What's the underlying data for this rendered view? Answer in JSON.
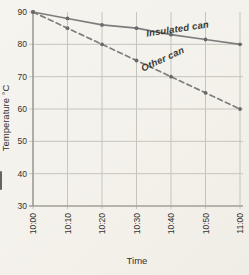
{
  "chart_data": {
    "type": "line",
    "title": "",
    "xlabel": "Time",
    "ylabel": "Temperature °C",
    "categories": [
      "10:00",
      "10:10",
      "10:20",
      "10:30",
      "10:40",
      "10:50",
      "11:00"
    ],
    "y_ticks": [
      90,
      80,
      70,
      60,
      50,
      40,
      30
    ],
    "ylim": [
      30,
      90
    ],
    "xlim": [
      "10:00",
      "11:00"
    ],
    "grid": true,
    "legend_position": "inline-labels-on-lines",
    "series": [
      {
        "name": "Insulated can",
        "line_style": "solid",
        "marker": "dot",
        "values": [
          90,
          88,
          86,
          85,
          83,
          81.5,
          80
        ]
      },
      {
        "name": "Other can",
        "line_style": "dashed",
        "marker": "dot",
        "values": [
          90,
          85,
          80,
          75,
          70,
          65,
          60
        ]
      }
    ]
  },
  "colors": {
    "paper": "#f5f3ee",
    "grid": "#c6c4bb",
    "axis": "#8f8d84",
    "series_line": "#7d7d7d",
    "marker": "#696969",
    "text": "#33322e"
  }
}
